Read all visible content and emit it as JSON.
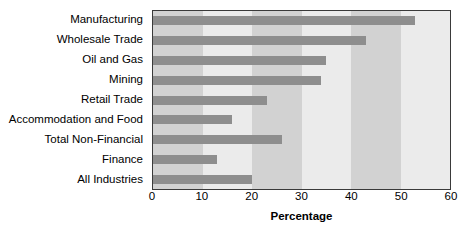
{
  "chart_data": {
    "type": "bar",
    "orientation": "horizontal",
    "title": "",
    "xlabel": "Percentage",
    "ylabel": "",
    "xlim": [
      0,
      60
    ],
    "xticks": [
      0,
      10,
      20,
      30,
      40,
      50,
      60
    ],
    "grid": false,
    "legend": null,
    "categories": [
      "Manufacturing",
      "Wholesale Trade",
      "Oil and Gas",
      "Mining",
      "Retail Trade",
      "Accommodation and Food",
      "Total Non-Financial",
      "Finance",
      "All Industries"
    ],
    "values": [
      53,
      43,
      35,
      34,
      23,
      16,
      26,
      13,
      20
    ],
    "colors": {
      "bar": "#8e8e8e",
      "band_dark": "#d2d2d2",
      "band_light": "#ebebeb",
      "axis": "#3a3a3a",
      "text": "#000000",
      "background": "#ffffff"
    },
    "background_bands": [
      {
        "from": 0,
        "to": 10,
        "shade": "dark"
      },
      {
        "from": 10,
        "to": 20,
        "shade": "light"
      },
      {
        "from": 20,
        "to": 30,
        "shade": "dark"
      },
      {
        "from": 30,
        "to": 40,
        "shade": "light"
      },
      {
        "from": 40,
        "to": 50,
        "shade": "dark"
      },
      {
        "from": 50,
        "to": 60,
        "shade": "light"
      }
    ]
  }
}
